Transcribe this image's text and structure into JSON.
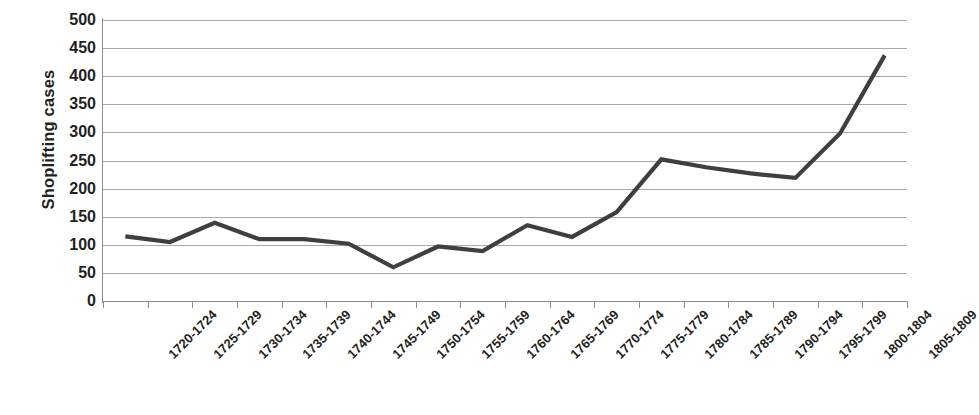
{
  "chart_data": {
    "type": "line",
    "title": "",
    "subtitle": "",
    "xlabel": "",
    "ylabel": "Shoplifting cases",
    "ylim": [
      0,
      500
    ],
    "ytick_step": 50,
    "yticks": [
      "500",
      "450",
      "400",
      "350",
      "300",
      "250",
      "200",
      "150",
      "100",
      "50",
      "0"
    ],
    "grid": true,
    "legend": "none",
    "line_color": "#3f3f3f",
    "gridline_color": "#9a9a9a",
    "axis_color": "#8d8d8d",
    "categories": [
      "1720-1724",
      "1725-1729",
      "1730-1734",
      "1735-1739",
      "1740-1744",
      "1745-1749",
      "1750-1754",
      "1755-1759",
      "1760-1764",
      "1765-1769",
      "1770-1774",
      "1775-1779",
      "1780-1784",
      "1785-1789",
      "1790-1794",
      "1795-1799",
      "1800-1804",
      "1805-1809"
    ],
    "values": [
      115,
      105,
      139,
      110,
      110,
      102,
      60,
      97,
      89,
      135,
      114,
      158,
      252,
      238,
      227,
      219,
      298,
      437
    ]
  }
}
